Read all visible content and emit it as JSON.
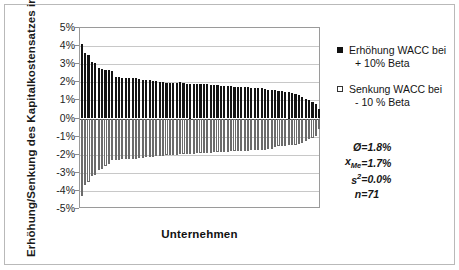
{
  "chart_data": {
    "type": "bar",
    "title": "",
    "xlabel": "Unternehmen",
    "ylabel": "Erhöhung/Senkung des Kapitalkostensatzes in %",
    "ylim": [
      -5,
      5
    ],
    "ytick_labels": [
      "5%",
      "4%",
      "3%",
      "2%",
      "1%",
      "0%",
      "-1%",
      "-2%",
      "-3%",
      "-4%",
      "-5%"
    ],
    "ytick_values": [
      5,
      4,
      3,
      2,
      1,
      0,
      -1,
      -2,
      -3,
      -4,
      -5
    ],
    "xtick_labels": [],
    "grid": true,
    "legend_position": "right",
    "categories": [
      "1",
      "2",
      "3",
      "4",
      "5",
      "6",
      "7",
      "8",
      "9",
      "10",
      "11",
      "12",
      "13",
      "14",
      "15",
      "16",
      "17",
      "18",
      "19",
      "20",
      "21",
      "22",
      "23",
      "24",
      "25",
      "26",
      "27",
      "28",
      "29",
      "30",
      "31",
      "32",
      "33",
      "34",
      "35",
      "36",
      "37",
      "38",
      "39",
      "40",
      "41",
      "42",
      "43",
      "44",
      "45",
      "46",
      "47",
      "48",
      "49",
      "50",
      "51",
      "52",
      "53",
      "54",
      "55",
      "56",
      "57",
      "58",
      "59",
      "60",
      "61",
      "62",
      "63",
      "64",
      "65",
      "66",
      "67",
      "68",
      "69",
      "70",
      "71"
    ],
    "series": [
      {
        "name": "Erhöhung WACC bei + 10% Beta",
        "color": "#141414",
        "values": [
          4.1,
          3.6,
          3.5,
          3.1,
          3.05,
          2.8,
          2.75,
          2.7,
          2.68,
          2.65,
          2.3,
          2.28,
          2.26,
          2.25,
          2.24,
          2.23,
          2.22,
          2.2,
          2.15,
          2.12,
          2.1,
          2.08,
          2.05,
          2.03,
          2.0,
          1.98,
          1.97,
          1.96,
          1.95,
          2.0,
          1.95,
          1.93,
          1.92,
          1.91,
          1.9,
          1.9,
          1.89,
          1.88,
          1.87,
          1.86,
          1.85,
          1.8,
          1.79,
          1.78,
          1.77,
          1.76,
          1.75,
          1.74,
          1.73,
          1.72,
          1.71,
          1.7,
          1.68,
          1.66,
          1.64,
          1.6,
          1.58,
          1.55,
          1.5,
          1.5,
          1.48,
          1.45,
          1.4,
          1.35,
          1.3,
          1.2,
          1.1,
          1.0,
          0.9,
          0.8,
          0.5
        ]
      },
      {
        "name": "Senkung WACC bei - 10 % Beta",
        "color": "#ffffff",
        "values": [
          -4.3,
          -3.7,
          -3.5,
          -3.2,
          -3.1,
          -2.85,
          -2.8,
          -2.6,
          -2.5,
          -2.3,
          -2.28,
          -2.27,
          -2.26,
          -2.25,
          -2.24,
          -2.23,
          -2.22,
          -2.2,
          -2.18,
          -2.15,
          -2.12,
          -2.1,
          -2.08,
          -2.06,
          -2.05,
          -2.04,
          -2.03,
          -2.02,
          -2.0,
          -1.98,
          -1.97,
          -1.96,
          -1.95,
          -1.94,
          -1.93,
          -1.92,
          -1.91,
          -1.9,
          -1.88,
          -1.87,
          -1.86,
          -1.85,
          -1.84,
          -1.83,
          -1.82,
          -1.81,
          -1.8,
          -1.79,
          -1.78,
          -1.77,
          -1.76,
          -1.75,
          -1.74,
          -1.73,
          -1.72,
          -1.7,
          -1.68,
          -1.55,
          -1.53,
          -1.52,
          -1.5,
          -1.48,
          -1.46,
          -1.44,
          -1.4,
          -1.35,
          -1.25,
          -1.15,
          -1.05,
          -0.95,
          -0.6
        ]
      }
    ],
    "annotations": [
      {
        "symbol": "Ø",
        "equals": "=",
        "value": "1.8%"
      },
      {
        "symbol": "x",
        "subscript": "Me",
        "equals": "=",
        "value": "1.7%"
      },
      {
        "symbol": "s",
        "superscript": "2",
        "equals": "=",
        "value": "0.0%"
      },
      {
        "symbol": "n",
        "equals": "=",
        "value": "71"
      }
    ]
  },
  "legend": {
    "entries": [
      {
        "marker": "filled-square-icon",
        "line1": "Erhöhung WACC bei",
        "line2": "+ 10% Beta"
      },
      {
        "marker": "hollow-square-icon",
        "line1": "Senkung WACC bei",
        "line2": "- 10 % Beta"
      }
    ]
  },
  "stats": {
    "mean_symbol": "Ø",
    "mean_eq": "=",
    "mean_value": "1.8%",
    "median_symbol": "x",
    "median_sub": "Me",
    "median_eq": "=",
    "median_value": "1.7%",
    "variance_symbol": "s",
    "variance_sup": "2",
    "variance_eq": "=",
    "variance_value": "0.0%",
    "count_symbol": "n",
    "count_eq": "=",
    "count_value": "71"
  }
}
